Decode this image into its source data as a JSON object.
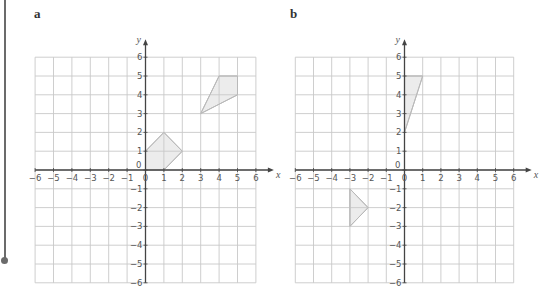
{
  "labels": {
    "part_a": "a",
    "part_b": "b"
  },
  "axes": {
    "x_name": "x",
    "y_name": "y"
  },
  "colors": {
    "grid": "#c8c8c8",
    "axis": "#444444",
    "shape_fill": "#ececec",
    "shape_stroke": "#b9b9b9"
  },
  "chart_data": [
    {
      "type": "scatter",
      "title": "a",
      "xlabel": "x",
      "ylabel": "y",
      "xlim": [
        -6,
        6
      ],
      "ylim": [
        -6,
        6
      ],
      "x_ticks": [
        -6,
        -5,
        -4,
        -3,
        -2,
        -1,
        0,
        1,
        2,
        3,
        4,
        5,
        6
      ],
      "y_ticks": [
        -6,
        -5,
        -4,
        -3,
        -2,
        -1,
        0,
        1,
        2,
        3,
        4,
        5,
        6
      ],
      "grid": true,
      "shapes": [
        {
          "name": "pentagon",
          "vertices": [
            [
              0,
              0
            ],
            [
              0,
              1
            ],
            [
              1,
              2
            ],
            [
              2,
              1
            ],
            [
              1,
              0
            ]
          ]
        },
        {
          "name": "quadrilateral",
          "vertices": [
            [
              3,
              3
            ],
            [
              4,
              5
            ],
            [
              5,
              5
            ],
            [
              5,
              4
            ]
          ]
        }
      ]
    },
    {
      "type": "scatter",
      "title": "b",
      "xlabel": "x",
      "ylabel": "y",
      "xlim": [
        -6,
        6
      ],
      "ylim": [
        -6,
        6
      ],
      "x_ticks": [
        -6,
        -5,
        -4,
        -3,
        -2,
        -1,
        0,
        1,
        2,
        3,
        4,
        5,
        6
      ],
      "y_ticks": [
        -6,
        -5,
        -4,
        -3,
        -2,
        -1,
        0,
        1,
        2,
        3,
        4,
        5,
        6
      ],
      "grid": true,
      "shapes": [
        {
          "name": "triangle-upper",
          "vertices": [
            [
              0,
              2
            ],
            [
              0,
              5
            ],
            [
              1,
              5
            ]
          ]
        },
        {
          "name": "triangle-lower",
          "vertices": [
            [
              -3,
              -1
            ],
            [
              -2,
              -2
            ],
            [
              -3,
              -3
            ]
          ]
        }
      ]
    }
  ]
}
